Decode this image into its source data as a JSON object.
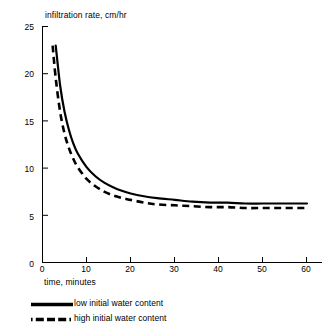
{
  "chart_data": {
    "type": "line",
    "title": "",
    "ylabel": "infiltration rate, cm/hr",
    "xlabel": "time, minutes",
    "xlim": [
      0,
      63
    ],
    "ylim": [
      0,
      26
    ],
    "xticks": [
      0,
      10,
      20,
      30,
      40,
      50,
      60
    ],
    "yticks": [
      0,
      5,
      10,
      15,
      20,
      25
    ],
    "xtick_labels": [
      "0",
      "10",
      "20",
      "30",
      "40",
      "50",
      "60"
    ],
    "ytick_labels": [
      "0",
      "5",
      "10",
      "15",
      "20",
      "25"
    ],
    "grid": false,
    "legend_position": "below-axes",
    "series": [
      {
        "name": "low initial water content",
        "style": "solid",
        "color": "#000000",
        "x": [
          3,
          4,
          5,
          6,
          7,
          8,
          10,
          12,
          14,
          16,
          18,
          20,
          23,
          26,
          30,
          34,
          38,
          42,
          46,
          50,
          54,
          58,
          60
        ],
        "y": [
          23.9,
          19.5,
          16.6,
          14.6,
          13.1,
          12.0,
          10.5,
          9.5,
          8.8,
          8.3,
          7.9,
          7.6,
          7.3,
          7.1,
          6.9,
          6.7,
          6.6,
          6.6,
          6.5,
          6.5,
          6.5,
          6.5,
          6.5
        ]
      },
      {
        "name": "high initial water content",
        "style": "dashed",
        "color": "#000000",
        "x": [
          2.3,
          3,
          4,
          5,
          6,
          7,
          8,
          10,
          12,
          14,
          16,
          18,
          20,
          23,
          26,
          30,
          34,
          38,
          42,
          46,
          50,
          54,
          58,
          60
        ],
        "y": [
          23.9,
          20.3,
          16.6,
          14.2,
          12.6,
          11.4,
          10.5,
          9.2,
          8.4,
          7.8,
          7.4,
          7.1,
          6.9,
          6.6,
          6.4,
          6.3,
          6.2,
          6.1,
          6.1,
          6.0,
          6.0,
          6.0,
          6.0,
          6.0
        ]
      }
    ],
    "annotations": []
  },
  "legend": {
    "items": [
      {
        "label": "low initial water content",
        "style": "solid"
      },
      {
        "label": "high initial water content",
        "style": "dashed"
      }
    ]
  }
}
